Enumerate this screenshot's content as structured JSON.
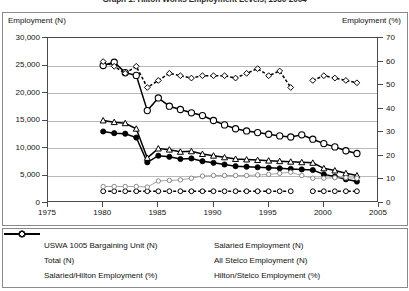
{
  "chart_data": {
    "type": "line",
    "title": "Graph 1: Hilton Works Employment Levels, 1980-2004",
    "xlabel": "",
    "ylabel": "Employment (N)",
    "y2label": "Employment (%)",
    "xlim": [
      1975,
      2005
    ],
    "ylim": [
      0,
      30000
    ],
    "y2lim": [
      0,
      70
    ],
    "xticks": [
      "1975",
      "1980",
      "1985",
      "1990",
      "1995",
      "2000",
      "2005"
    ],
    "yticks": [
      "0",
      "5,000",
      "10,000",
      "15,000",
      "20,000",
      "25,000",
      "30,000"
    ],
    "y2ticks": [
      "0",
      "10",
      "20",
      "30",
      "40",
      "50",
      "60",
      "70"
    ],
    "grid": true,
    "legend_position": "bottom",
    "series": [
      {
        "name": "USWA 1005 Bargaining Unit (N)",
        "axis": "left",
        "marker": "filled-circle",
        "line": "solid",
        "color": "#000000",
        "x": [
          1980,
          1981,
          1982,
          1983,
          1984,
          1985,
          1986,
          1987,
          1988,
          1989,
          1990,
          1991,
          1992,
          1993,
          1994,
          1995,
          1996,
          1997,
          1998,
          1999,
          2000,
          2001,
          2002,
          2003
        ],
        "y": [
          13000,
          12700,
          12600,
          11900,
          7400,
          8600,
          8400,
          8000,
          8100,
          7600,
          7300,
          7000,
          6700,
          6600,
          6500,
          6400,
          6300,
          6200,
          6100,
          6000,
          5200,
          4800,
          4300,
          3900
        ]
      },
      {
        "name": "Total (N)",
        "axis": "left",
        "marker": "open-triangle",
        "line": "solid",
        "color": "#000000",
        "x": [
          1980,
          1981,
          1982,
          1983,
          1984,
          1985,
          1986,
          1987,
          1988,
          1989,
          1990,
          1991,
          1992,
          1993,
          1994,
          1995,
          1996,
          1997,
          1998,
          1999,
          2000,
          2001,
          2002,
          2003
        ],
        "y": [
          15000,
          14700,
          14500,
          13500,
          8200,
          9900,
          9700,
          9300,
          9400,
          8900,
          8600,
          8300,
          8000,
          7900,
          7800,
          7700,
          7600,
          7500,
          7400,
          7300,
          6300,
          5900,
          5400,
          5000
        ]
      },
      {
        "name": "Salaried/Hilton Employment (%)",
        "axis": "right",
        "marker": "open-circle",
        "line": "dashed",
        "color": "#000000",
        "x": [
          1980,
          1981,
          1982,
          1983,
          1984,
          1985,
          1986,
          1987,
          1988,
          1989,
          1990,
          1991,
          1992,
          1993,
          1994,
          1995,
          1996,
          1997,
          1999,
          2000,
          2001,
          2002,
          2003
        ],
        "y": [
          5,
          5,
          5,
          5,
          5,
          5,
          5,
          5,
          5,
          5,
          5,
          5,
          5,
          5,
          5,
          5,
          5,
          5,
          5,
          5,
          5,
          5,
          5
        ]
      },
      {
        "name": "Salaried Employment (N)",
        "axis": "left",
        "marker": "small-open-circle",
        "line": "solid-light",
        "color": "#9a9a9a",
        "x": [
          1980,
          1981,
          1982,
          1983,
          1984,
          1985,
          1986,
          1987,
          1988,
          1989,
          1990,
          1991,
          1992,
          1993,
          1994,
          1995,
          1996,
          1997,
          1998,
          1999,
          2000,
          2001,
          2002,
          2003
        ],
        "y": [
          3000,
          3000,
          3000,
          3000,
          2900,
          4000,
          4100,
          4200,
          4500,
          4900,
          5000,
          5000,
          5000,
          5000,
          5100,
          5200,
          5400,
          5600,
          5000,
          4500,
          4500,
          4600,
          4600,
          4500
        ]
      },
      {
        "name": "All Stelco Employment (N)",
        "axis": "left",
        "marker": "large-open-circle",
        "line": "solid",
        "color": "#000000",
        "x": [
          1980,
          1981,
          1982,
          1983,
          1984,
          1985,
          1986,
          1987,
          1988,
          1989,
          1990,
          1991,
          1992,
          1993,
          1994,
          1995,
          1996,
          1997,
          1998,
          1999,
          2000,
          2001,
          2002,
          2003
        ],
        "y": [
          25000,
          25600,
          23700,
          23200,
          16800,
          19100,
          17600,
          17000,
          16400,
          15900,
          15000,
          14200,
          13500,
          13100,
          12800,
          12500,
          12200,
          12000,
          12400,
          11600,
          10800,
          10200,
          9500,
          9000
        ]
      },
      {
        "name": "Hilton/Stelco Employment (%)",
        "axis": "right",
        "marker": "open-diamond",
        "line": "dashed",
        "color": "#000000",
        "x": [
          1980,
          1981,
          1982,
          1983,
          1984,
          1985,
          1986,
          1987,
          1988,
          1989,
          1990,
          1991,
          1992,
          1993,
          1994,
          1995,
          1996,
          1997,
          1999,
          2000,
          2001,
          2002,
          2003
        ],
        "y": [
          60,
          58,
          55,
          58,
          49,
          52,
          55,
          54,
          53,
          54,
          54,
          54,
          53,
          55,
          57,
          54,
          56,
          49,
          52,
          54,
          53,
          52,
          51
        ]
      }
    ]
  },
  "legend": {
    "items": [
      {
        "label": "USWA 1005 Bargaining Unit (N)",
        "marker": "filled-circle",
        "line": "solid"
      },
      {
        "label": "Salaried Employment (N)",
        "marker": "small-open-circle",
        "line": "solid-light"
      },
      {
        "label": "Total (N)",
        "marker": "open-triangle",
        "line": "solid"
      },
      {
        "label": "All Stelco Employment (N)",
        "marker": "large-open-circle",
        "line": "solid"
      },
      {
        "label": "Salaried/Hilton Employment (%)",
        "marker": "open-circle",
        "line": "dashed"
      },
      {
        "label": "Hilton/Stelco Employment (%)",
        "marker": "open-diamond",
        "line": "dashed"
      }
    ]
  }
}
